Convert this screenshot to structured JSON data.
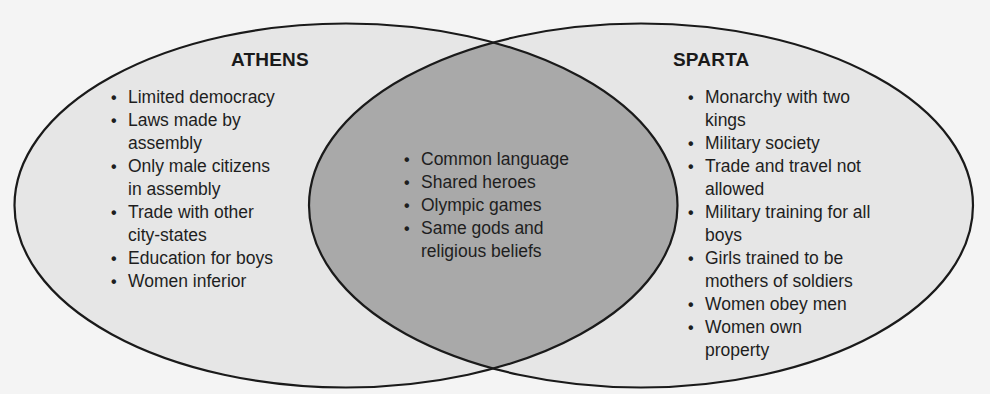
{
  "diagram": {
    "type": "venn",
    "colors": {
      "background": "#f4f4f4",
      "set_fill": "#e6e6e6",
      "overlap_fill": "#a9a9a9",
      "outline": "#1a1a1a",
      "text": "#1e1e1e"
    },
    "left_set": {
      "title": "ATHENS",
      "items": [
        "Limited democracy",
        "Laws made by assembly",
        "Only male citizens in assembly",
        "Trade with other city-states",
        "Education for boys",
        "Women inferior"
      ],
      "lines": [
        [
          "Limited democracy"
        ],
        [
          "Laws made by",
          "assembly"
        ],
        [
          "Only male citizens",
          "in assembly"
        ],
        [
          "Trade with other",
          "city-states"
        ],
        [
          "Education for boys"
        ],
        [
          "Women inferior"
        ]
      ]
    },
    "overlap": {
      "items": [
        "Common language",
        "Shared heroes",
        "Olympic games",
        "Same gods and religious beliefs"
      ],
      "lines": [
        [
          "Common language"
        ],
        [
          "Shared heroes"
        ],
        [
          "Olympic games"
        ],
        [
          "Same gods and",
          "religious beliefs"
        ]
      ]
    },
    "right_set": {
      "title": "SPARTA",
      "items": [
        "Monarchy with two kings",
        "Military society",
        "Trade and travel not allowed",
        "Military training for all boys",
        "Girls trained to be mothers of soldiers",
        "Women obey men",
        "Women own property"
      ],
      "lines": [
        [
          "Monarchy with two",
          "kings"
        ],
        [
          "Military society"
        ],
        [
          "Trade and travel not",
          "allowed"
        ],
        [
          "Military training for all",
          "boys"
        ],
        [
          "Girls trained to be",
          "mothers of soldiers"
        ],
        [
          "Women obey men"
        ],
        [
          "Women own",
          "property"
        ]
      ]
    }
  }
}
